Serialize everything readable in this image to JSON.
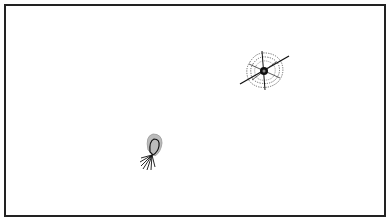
{
  "canvas": {
    "width": 390,
    "height": 219,
    "background": "#ffffff",
    "frame_color": "#222222"
  },
  "figures": [
    {
      "name": "web-figure",
      "center": [
        264,
        71
      ],
      "ring_color": "#666666",
      "line_color": "#111111"
    },
    {
      "name": "loop-figure",
      "center": [
        153,
        150
      ],
      "fill_color": "#bbbbbb",
      "line_color": "#111111"
    }
  ]
}
